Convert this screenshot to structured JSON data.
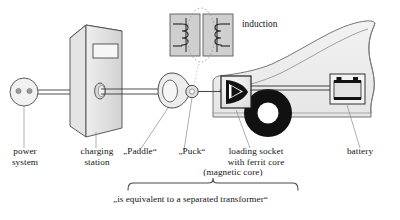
{
  "diagram": {
    "title_absent": true,
    "colors": {
      "stroke": "#3a3a3a",
      "fill_light": "#f0f0f0",
      "fill_gray": "#d9d9d9",
      "fill_mid": "#cfcfcf",
      "black": "#111111",
      "background": "#ffffff",
      "leader": "#8a8a8a"
    },
    "labels": {
      "power_system": "power\nsystem",
      "charging_station": "charging\nstation",
      "paddle": "„Paddle“",
      "puck": "„Puck“",
      "loading_socket": "loading socket\nwith ferrit core",
      "magnetic_core": "(magnetic core)",
      "battery": "battery",
      "induction": "induction",
      "caption": "„is equivalent to a separated transformer“"
    },
    "components": [
      {
        "name": "power-outlet",
        "label": "power system",
        "shape": "circle-with-two-pins"
      },
      {
        "name": "charging-station",
        "label": "charging station",
        "shape": "isometric-box-with-display"
      },
      {
        "name": "paddle",
        "label": "„Paddle“",
        "shape": "teardrop-with-oval"
      },
      {
        "name": "puck",
        "label": "„Puck“",
        "shape": "small-circle"
      },
      {
        "name": "loading-socket",
        "label": "loading socket with ferrit core",
        "shape": "box-with-black-arrow"
      },
      {
        "name": "battery",
        "label": "battery",
        "shape": "rectangle-with-terminals"
      },
      {
        "name": "car-body",
        "label": "car",
        "shape": "silhouette"
      },
      {
        "name": "wheel",
        "label": "wheel",
        "shape": "black-annulus"
      },
      {
        "name": "transformer-primary",
        "label": "coil",
        "shape": "coil-in-box"
      },
      {
        "name": "transformer-secondary",
        "label": "coil",
        "shape": "coil-in-box"
      },
      {
        "name": "induction-ellipse",
        "label": "induction",
        "shape": "dotted-ellipse"
      }
    ]
  }
}
